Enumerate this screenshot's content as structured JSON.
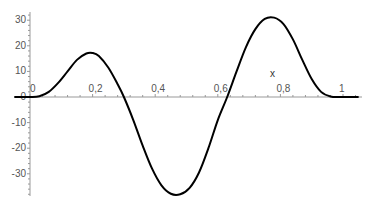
{
  "chart_data": {
    "type": "line",
    "title": "",
    "xlabel": "x",
    "ylabel": "",
    "xlim": [
      -0.05,
      1.06
    ],
    "ylim": [
      -40,
      31
    ],
    "grid": false,
    "legend": null,
    "x_ticks": [
      {
        "value": 0,
        "label": "0"
      },
      {
        "value": 0.2,
        "label": "0,2"
      },
      {
        "value": 0.4,
        "label": "0,4"
      },
      {
        "value": 0.6,
        "label": "0,6"
      },
      {
        "value": 0.8,
        "label": "0,8"
      },
      {
        "value": 1,
        "label": "1"
      }
    ],
    "y_ticks": [
      {
        "value": 30,
        "label": "30"
      },
      {
        "value": 20,
        "label": "20"
      },
      {
        "value": 10,
        "label": "10"
      },
      {
        "value": 0,
        "label": "0"
      },
      {
        "value": -10,
        "label": "-10"
      },
      {
        "value": -20,
        "label": "-20"
      },
      {
        "value": -30,
        "label": "-30"
      }
    ],
    "series": [
      {
        "name": "f(x)",
        "color": "#000000",
        "x": [
          -0.05,
          0,
          0.03,
          0.06,
          0.09,
          0.12,
          0.15,
          0.18,
          0.2,
          0.22,
          0.25,
          0.28,
          0.3,
          0.33,
          0.36,
          0.39,
          0.42,
          0.45,
          0.48,
          0.51,
          0.54,
          0.57,
          0.6,
          0.63,
          0.66,
          0.69,
          0.72,
          0.75,
          0.78,
          0.81,
          0.84,
          0.87,
          0.9,
          0.93,
          0.96,
          0.99,
          1.0,
          1.05
        ],
        "y": [
          0,
          0,
          0.3,
          2,
          5.5,
          10,
          14.5,
          17,
          17.2,
          16,
          11.5,
          5,
          0,
          -9,
          -19,
          -28,
          -34.5,
          -37.8,
          -38,
          -35.5,
          -29.5,
          -20,
          -9,
          0,
          10,
          19.5,
          26.5,
          30.5,
          31,
          28.5,
          22.5,
          14.5,
          7,
          2,
          0.2,
          0,
          0,
          0
        ]
      }
    ]
  }
}
